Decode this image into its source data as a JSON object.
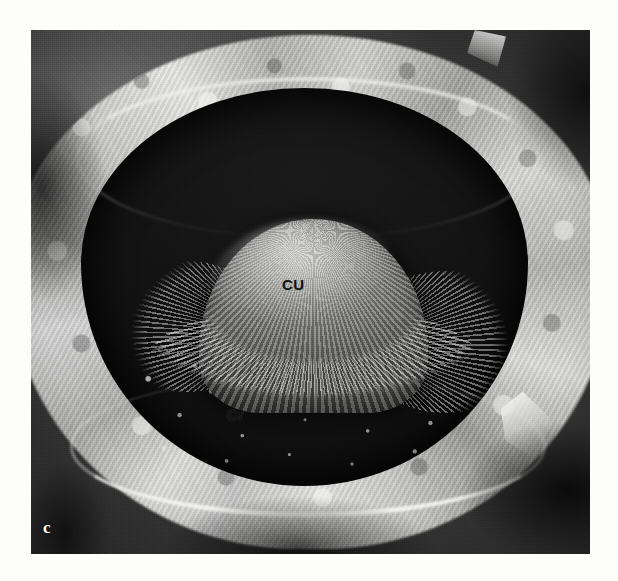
{
  "figure": {
    "panel_letter": "c",
    "modality": "scanning-electron-micrograph",
    "background_color": "#fdfdfc",
    "plate": {
      "x": 31,
      "y": 30,
      "width": 559,
      "height": 524,
      "dominant_color": "#3a3a3a"
    }
  },
  "annotations": [
    {
      "id": "cupula",
      "text": "CU",
      "meaning": "cupula",
      "color": "#121212",
      "x": 282,
      "y": 277
    },
    {
      "id": "crista",
      "text": "Cr",
      "meaning": "crista",
      "color": "#121212",
      "x": 227,
      "y": 407
    }
  ],
  "structures": [
    {
      "id": "bony-rim",
      "label": "fractured bony rim",
      "tone": "bright"
    },
    {
      "id": "chamber",
      "label": "ampullary lumen",
      "tone": "dark"
    },
    {
      "id": "cupula-dome",
      "label": "cupula dome",
      "tone": "mid"
    },
    {
      "id": "ciliary-fringe",
      "label": "ciliary bundles of crista",
      "tone": "bright"
    },
    {
      "id": "chamber-floor",
      "label": "speckled ampullary floor",
      "tone": "mid-dark"
    }
  ],
  "palette": {
    "page": "#fdfdfc",
    "rim_highlight": "#efefee",
    "chamber_dark": "#141414",
    "cupula_mid": "#8e8e8c",
    "label_dark": "#121212",
    "label_light": "#ffffff"
  }
}
